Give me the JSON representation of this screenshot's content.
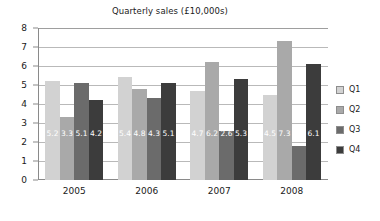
{
  "chart_data": {
    "type": "bar",
    "title": "Quarterly sales (£10,000s)",
    "xlabel": "",
    "ylabel": "",
    "categories": [
      "2005",
      "2006",
      "2007",
      "2008"
    ],
    "series": [
      {
        "name": "Q1",
        "color": "#d2d2d2",
        "values": [
          5.2,
          5.4,
          4.7,
          4.5
        ]
      },
      {
        "name": "Q2",
        "color": "#a9a9a9",
        "values": [
          3.3,
          4.8,
          6.2,
          7.3
        ]
      },
      {
        "name": "Q3",
        "color": "#6b6b6b",
        "values": [
          5.1,
          4.3,
          2.6,
          1.8
        ]
      },
      {
        "name": "Q4",
        "color": "#3c3c3c",
        "values": [
          4.2,
          5.1,
          5.3,
          6.1
        ]
      }
    ],
    "ylim": [
      0,
      8
    ],
    "y_ticks": [
      "0",
      "1",
      "2",
      "3",
      "4",
      "5",
      "6",
      "7",
      "8"
    ],
    "grid": true,
    "legend_position": "right",
    "data_labels": true
  },
  "legend": {
    "items": [
      {
        "label": "Q1"
      },
      {
        "label": "Q2"
      },
      {
        "label": "Q3"
      },
      {
        "label": "Q4"
      }
    ]
  }
}
